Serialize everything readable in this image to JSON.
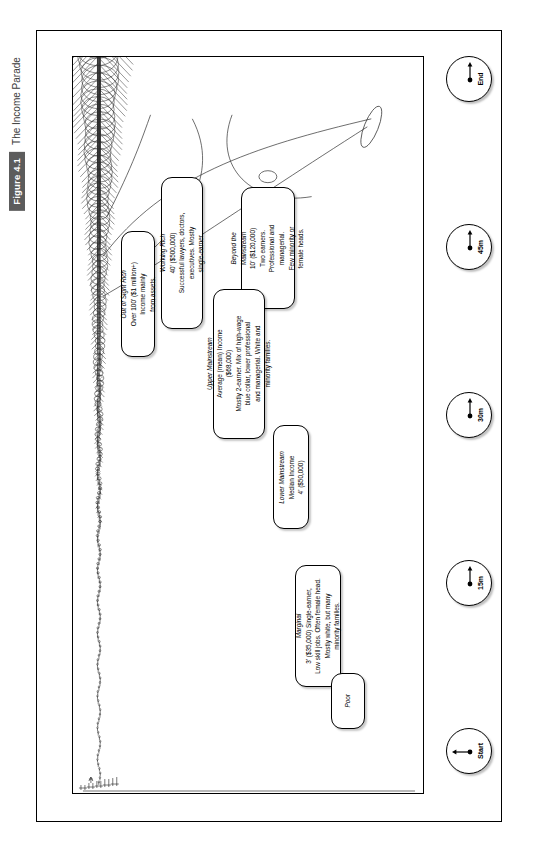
{
  "figure": {
    "tag": "Figure 4.1",
    "title": "The Income Parade"
  },
  "chart_data": {
    "type": "diagram",
    "title": "The Income Parade",
    "xlabel": "Elapsed time of parade",
    "ylabel": "Height (income)",
    "timeline": [
      "Start",
      "15m",
      "30m",
      "45m",
      "End"
    ],
    "categories": [
      "Poor",
      "Marginal",
      "Lower Mainstream",
      "Upper Mainstream",
      "Beyond the Mainstream",
      "Working Rich",
      "Out of Sight Rich"
    ],
    "values": [
      0,
      35000,
      50000,
      68000,
      120000,
      500000,
      1000000
    ],
    "heights_feet": [
      0,
      3,
      4,
      5.5,
      10,
      40,
      100
    ]
  },
  "callouts": [
    {
      "id": "poor",
      "head": "Poor",
      "lines": []
    },
    {
      "id": "marginal",
      "head": "Marginal",
      "lines": [
        "3' ($35,000) Single-earner,",
        "Low skill jobs. Often female head.",
        "Mostly white, but many",
        "minority families."
      ]
    },
    {
      "id": "lower-mainstream",
      "head": "Lower Mainstream",
      "lines": [
        "Median Income",
        "4' ($50,000)"
      ]
    },
    {
      "id": "upper-mainstream",
      "head": "Upper Mainstream",
      "lines": [
        "Average (mean) Income",
        "($68,000)",
        "Mostly 2-earner. Mix of high-wage",
        "blue collar, lower professional",
        "and managerial. White and",
        "minority families."
      ]
    },
    {
      "id": "beyond-mainstream",
      "head": "Beyond the",
      "head2": "Mainstream",
      "lines": [
        "10' ($120,000)",
        "Two earners.",
        "Professional and",
        "managerial.",
        "Few minority or",
        "female heads."
      ]
    },
    {
      "id": "working-rich",
      "head": "Working Rich",
      "lines": [
        "40' ($500,000)",
        "Successful lawyers, doctors,",
        "executives. Mostly",
        "single-earner."
      ]
    },
    {
      "id": "out-of-sight-rich",
      "head": "Out of Sight Rich",
      "lines": [
        "Over 100' ($1 million+)",
        "Income mainly",
        "from assets."
      ]
    }
  ],
  "clocks": [
    {
      "label": "Start",
      "angle": 270
    },
    {
      "label": "15m",
      "angle": 0
    },
    {
      "label": "30m",
      "angle": 90
    },
    {
      "label": "45m",
      "angle": 180
    },
    {
      "label": "End",
      "angle": 270
    }
  ],
  "colors": {
    "ink": "#000000",
    "caption_bar": "#5c5c5c",
    "paper": "#ffffff"
  }
}
